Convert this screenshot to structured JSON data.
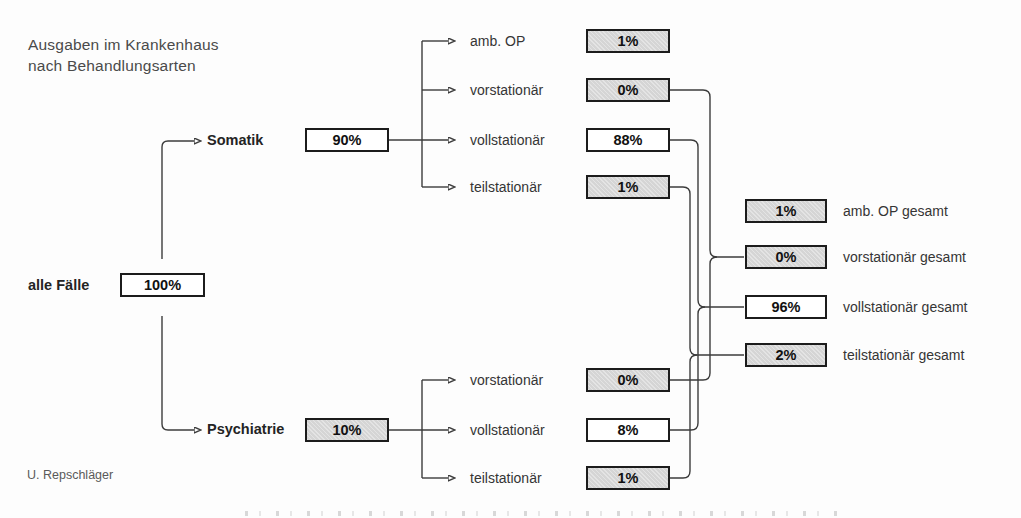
{
  "title": {
    "line1": "Ausgaben im Krankenhaus",
    "line2": "nach Behandlungsarten"
  },
  "credit": "U. Repschläger",
  "colors": {
    "box_border": "#1c1c1c",
    "box_white": "#ffffff",
    "box_shaded": "#d5d5d5",
    "line": "#3c3c3c",
    "text": "#353535"
  },
  "root": {
    "label": "alle Fälle",
    "value": "100%",
    "shaded": false
  },
  "branches": [
    {
      "label": "Somatik",
      "value": "90%",
      "shaded": false,
      "children": [
        {
          "label": "amb. OP",
          "value": "1%",
          "shaded": true
        },
        {
          "label": "vorstationär",
          "value": "0%",
          "shaded": true
        },
        {
          "label": "vollstationär",
          "value": "88%",
          "shaded": false
        },
        {
          "label": "teilstationär",
          "value": "1%",
          "shaded": true
        }
      ]
    },
    {
      "label": "Psychiatrie",
      "value": "10%",
      "shaded": true,
      "children": [
        {
          "label": "vorstationär",
          "value": "0%",
          "shaded": true
        },
        {
          "label": "vollstationär",
          "value": "8%",
          "shaded": false
        },
        {
          "label": "teilstationär",
          "value": "1%",
          "shaded": true
        }
      ]
    }
  ],
  "totals": [
    {
      "label": "amb. OP gesamt",
      "value": "1%",
      "shaded": true
    },
    {
      "label": "vorstationär gesamt",
      "value": "0%",
      "shaded": true
    },
    {
      "label": "vollstationär gesamt",
      "value": "96%",
      "shaded": false
    },
    {
      "label": "teilstationär gesamt",
      "value": "2%",
      "shaded": true
    }
  ]
}
